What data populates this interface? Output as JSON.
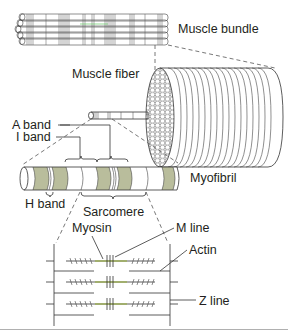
{
  "diagram": {
    "colors": {
      "band_fill": "#b9bd9c",
      "myosin": "#8a9a4a",
      "line": "#333333",
      "divider": "#b0b0b0"
    },
    "labels": {
      "muscle_bundle": "Muscle bundle",
      "muscle_fiber": "Muscle fiber",
      "a_band": "A band",
      "i_band": "I band",
      "myofibril": "Myofibril",
      "h_band": "H band",
      "sarcomere": "Sarcomere",
      "myosin": "Myosin",
      "m_line": "M line",
      "actin": "Actin",
      "z_line": "Z line"
    }
  }
}
